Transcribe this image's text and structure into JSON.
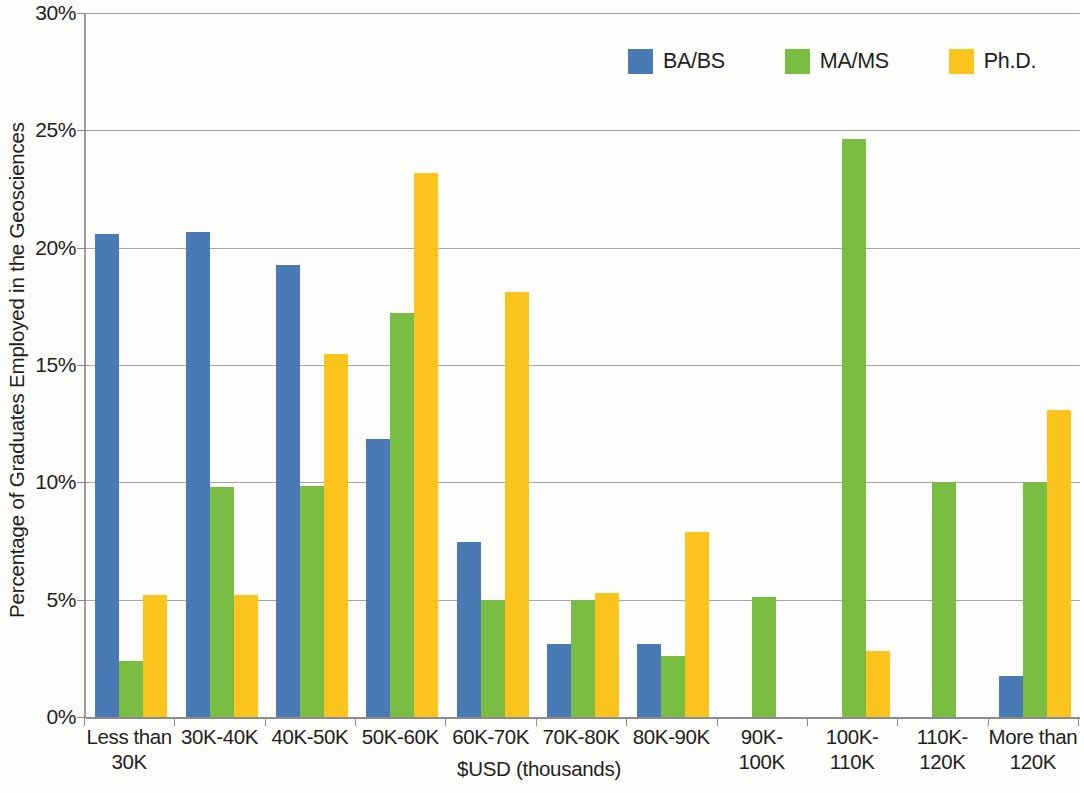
{
  "chart_data": {
    "type": "bar",
    "title": "",
    "xlabel": "$USD (thousands)",
    "ylabel": "Percentage of Graduates Employed in the Geosciences",
    "ylim": [
      0,
      30
    ],
    "ytick_labels": [
      "0%",
      "5%",
      "10%",
      "15%",
      "20%",
      "25%",
      "30%"
    ],
    "ytick_values": [
      0,
      5,
      10,
      15,
      20,
      25,
      30
    ],
    "grid": true,
    "legend_position": "top-right",
    "categories": [
      "Less than\n30K",
      "30K-40K",
      "40K-50K",
      "50K-60K",
      "60K-70K",
      "70K-80K",
      "80K-90K",
      "90K-\n100K",
      "100K-\n110K",
      "110K-\n120K",
      "More than\n120K"
    ],
    "series": [
      {
        "name": "BA/BS",
        "color": "#4a7ab5",
        "values": [
          20.6,
          20.65,
          19.25,
          11.85,
          7.45,
          3.1,
          3.1,
          0,
          0,
          0,
          1.75
        ]
      },
      {
        "name": "MA/MS",
        "color": "#79bd42",
        "values": [
          2.4,
          9.8,
          9.85,
          17.2,
          5.0,
          5.0,
          2.6,
          5.1,
          24.65,
          10.0,
          10.0
        ]
      },
      {
        "name": "Ph.D.",
        "color": "#fbc41c",
        "values": [
          5.2,
          5.2,
          15.45,
          23.2,
          18.1,
          5.3,
          7.9,
          0,
          2.8,
          0,
          13.1
        ]
      }
    ]
  }
}
